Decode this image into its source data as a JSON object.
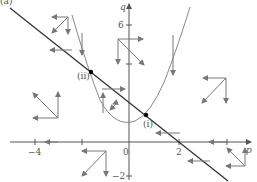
{
  "figure": {
    "corner_label": "(a)",
    "axes": {
      "x_label": "p",
      "y_label": "q",
      "x_ticks": [
        {
          "value": -4,
          "label": "−4"
        },
        {
          "value": -1,
          "label": ""
        },
        {
          "value": 0,
          "label": "0"
        },
        {
          "value": 2,
          "label": "2"
        },
        {
          "value": 4,
          "label": ""
        }
      ],
      "y_ticks": [
        {
          "value": 6,
          "label": "6"
        },
        {
          "value": 2,
          "label": ""
        },
        {
          "value": -2,
          "label": "−2"
        }
      ]
    },
    "curves": [
      {
        "name": "line",
        "equation": "q = 2 - p"
      },
      {
        "name": "parabola",
        "equation": "q = p^2 + 1 (approx.)"
      }
    ],
    "equilibria": [
      {
        "label": "(i)",
        "p": 0.7,
        "q": 1.3
      },
      {
        "label": "(ii)",
        "p": -2.1,
        "q": 4.1
      }
    ],
    "direction_arrows_icon": "arrow-icon",
    "colors": {
      "line": "#333333",
      "parabola": "#888888",
      "arrows": "#777777",
      "axes": "#555555"
    }
  }
}
